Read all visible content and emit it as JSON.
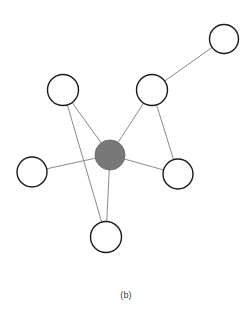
{
  "figure": {
    "caption": "(b)",
    "background_color": "#ffffff"
  },
  "chart_data": {
    "type": "diagram",
    "diagram_kind": "node-link-graph",
    "title": "(b)",
    "xlabel": "",
    "ylabel": "",
    "grid": false,
    "legend": null,
    "coordinate_space": {
      "width": 252,
      "height": 324,
      "origin": "top-left"
    },
    "styles": {
      "hub_fill": "#787878",
      "hub_stroke": "#6f6f6f",
      "node_fill": "#ffffff",
      "node_stroke": "#1a1a1a",
      "node_stroke_width": 1.4,
      "edge_stroke": "#8a8a8a",
      "edge_stroke_width": 1
    },
    "nodes": [
      {
        "id": "hub",
        "label": "",
        "x": 110,
        "y": 155,
        "r": 15,
        "type": "filled",
        "fill": "#787878"
      },
      {
        "id": "top-right",
        "label": "",
        "x": 224,
        "y": 39,
        "r": 14.5,
        "type": "open",
        "fill": "#ffffff"
      },
      {
        "id": "upper-middle",
        "label": "",
        "x": 152,
        "y": 90,
        "r": 15.5,
        "type": "open",
        "fill": "#ffffff"
      },
      {
        "id": "upper-left",
        "label": "",
        "x": 63,
        "y": 90,
        "r": 15.5,
        "type": "open",
        "fill": "#ffffff"
      },
      {
        "id": "left",
        "label": "",
        "x": 32,
        "y": 172,
        "r": 15,
        "type": "open",
        "fill": "#ffffff"
      },
      {
        "id": "right",
        "label": "",
        "x": 178,
        "y": 174,
        "r": 15,
        "type": "open",
        "fill": "#ffffff"
      },
      {
        "id": "bottom",
        "label": "",
        "x": 106,
        "y": 237,
        "r": 15.5,
        "type": "open",
        "fill": "#ffffff"
      }
    ],
    "edges": [
      {
        "source": "hub",
        "target": "upper-middle"
      },
      {
        "source": "hub",
        "target": "upper-left"
      },
      {
        "source": "hub",
        "target": "left"
      },
      {
        "source": "hub",
        "target": "right"
      },
      {
        "source": "hub",
        "target": "bottom"
      },
      {
        "source": "upper-middle",
        "target": "top-right"
      },
      {
        "source": "upper-middle",
        "target": "right"
      },
      {
        "source": "upper-left",
        "target": "bottom"
      }
    ],
    "counts": {
      "nodes": 7,
      "edges": 8,
      "filled_nodes": 1,
      "open_nodes": 6
    }
  }
}
